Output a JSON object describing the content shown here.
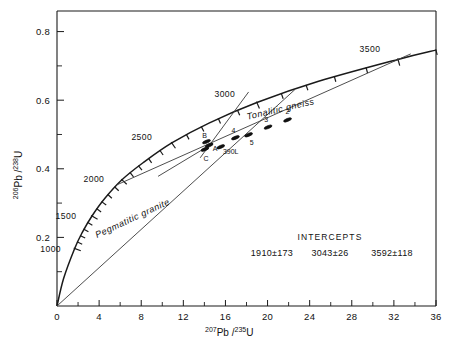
{
  "chart_data": {
    "type": "scatter",
    "title": "",
    "xlabel": "207Pb/235U",
    "ylabel": "206Pb/238U",
    "xlabel_parts": {
      "sup1": "207",
      "mid": "Pb /",
      "sup2": "235",
      "base": "U"
    },
    "ylabel_parts": {
      "sup1": "206",
      "mid": "Pb /",
      "sup2": "238",
      "base": "U"
    },
    "xlim": [
      0,
      36
    ],
    "ylim": [
      0,
      0.86
    ],
    "xticks": [
      0,
      4,
      8,
      12,
      16,
      20,
      24,
      28,
      32,
      36
    ],
    "xticklabels": [
      "0",
      "4",
      "8",
      "12",
      "16",
      "20",
      "24",
      "28",
      "32",
      "36"
    ],
    "xminorstep": 2,
    "yticks": [
      0.2,
      0.4,
      0.6,
      0.8
    ],
    "yticklabels": [
      "0.2",
      "0.4",
      "0.6",
      "0.8"
    ],
    "yminorticks": [
      0.1,
      0.3,
      0.5,
      0.7
    ],
    "grid": false,
    "legend": "none",
    "concordia": {
      "name": "concordia-curve",
      "points": [
        {
          "age": 0,
          "x": 0.0,
          "y": 0.0
        },
        {
          "age": 500,
          "x": 0.6339,
          "y": 0.0808
        },
        {
          "age": 1000,
          "x": 1.6787,
          "y": 0.1678
        },
        {
          "age": 1250,
          "x": 2.3896,
          "y": 0.2139
        },
        {
          "age": 1500,
          "x": 3.3228,
          "y": 0.2623
        },
        {
          "age": 1750,
          "x": 4.5309,
          "y": 0.3132
        },
        {
          "age": 2000,
          "x": 6.1682,
          "y": 0.3679
        },
        {
          "age": 2250,
          "x": 8.172,
          "y": 0.4176
        },
        {
          "age": 2500,
          "x": 10.901,
          "y": 0.4754
        },
        {
          "age": 2750,
          "x": 14.434,
          "y": 0.5333
        },
        {
          "age": 3000,
          "x": 18.985,
          "y": 0.5932
        },
        {
          "age": 3250,
          "x": 24.847,
          "y": 0.655
        },
        {
          "age": 3500,
          "x": 32.389,
          "y": 0.7189
        },
        {
          "age": 3600,
          "x": 36.0,
          "y": 0.746
        }
      ],
      "age_ticks": [
        1000,
        1100,
        1200,
        1300,
        1400,
        1500,
        1600,
        1700,
        1800,
        1900,
        2000,
        2100,
        2200,
        2300,
        2400,
        2500,
        2600,
        2700,
        2800,
        2900,
        3000,
        3100,
        3200,
        3300,
        3400,
        3500,
        3600
      ],
      "age_labels": [
        {
          "age": 1000,
          "text": "1000",
          "dx": -24,
          "dy": 4
        },
        {
          "age": 1500,
          "text": "1500",
          "dx": -26,
          "dy": 3
        },
        {
          "age": 2000,
          "text": "2000",
          "dx": -28,
          "dy": 2
        },
        {
          "age": 2500,
          "text": "2500",
          "dx": -30,
          "dy": -3
        },
        {
          "age": 3000,
          "text": "3000",
          "dx": -32,
          "dy": -6
        },
        {
          "age": 3500,
          "text": "3500",
          "dx": -28,
          "dy": -7
        }
      ]
    },
    "chords": [
      {
        "name": "pegmatitic-granite",
        "label": "Pegmatitic granite",
        "lower_intercept": 0,
        "upper_intercept": 3043,
        "x0": 0.0,
        "y0": 0.0,
        "x1": 22.6,
        "y1": 0.631,
        "label_x": 7.3,
        "label_y": 0.248,
        "label_rot": -25
      },
      {
        "name": "tonalitic-gneiss",
        "label": "Tonalitic gneiss",
        "lower_intercept": 1910,
        "upper_intercept": 3592,
        "x0": 5.6,
        "y0": 0.352,
        "x1": 33.6,
        "y1": 0.735,
        "label_x": 21.3,
        "label_y": 0.566,
        "label_rot": -13
      },
      {
        "name": "discordia-steep",
        "x0": 13.6,
        "y0": 0.432,
        "x1": 18.2,
        "y1": 0.624
      },
      {
        "name": "discordia-lower",
        "x0": 9.6,
        "y0": 0.378,
        "x1": 14.8,
        "y1": 0.474
      }
    ],
    "points": [
      {
        "label": "A",
        "x": 14.45,
        "y": 0.4685,
        "lx": 6,
        "ly": 6
      },
      {
        "label": "B",
        "x": 14.2,
        "y": 0.479,
        "lx": -2,
        "ly": -4
      },
      {
        "label": "C",
        "x": 14.05,
        "y": 0.457,
        "lx": 1,
        "ly": 12
      },
      {
        "label": "390L",
        "x": 15.55,
        "y": 0.464,
        "lx": 10,
        "ly": 7
      },
      {
        "label": "5",
        "x": 18.2,
        "y": 0.499,
        "lx": 3,
        "ly": 10
      },
      {
        "label": "4",
        "x": 16.95,
        "y": 0.4905,
        "lx": -2,
        "ly": -5
      },
      {
        "label": "3",
        "x": 20.05,
        "y": 0.5215,
        "lx": -2,
        "ly": -5
      },
      {
        "label": "2",
        "x": 21.9,
        "y": 0.5425,
        "lx": 0,
        "ly": -6
      }
    ],
    "annotations": {
      "intercepts_title": "INTERCEPTS",
      "intercepts_values": [
        "1910±173",
        "3043±26",
        "3592±118"
      ]
    }
  }
}
